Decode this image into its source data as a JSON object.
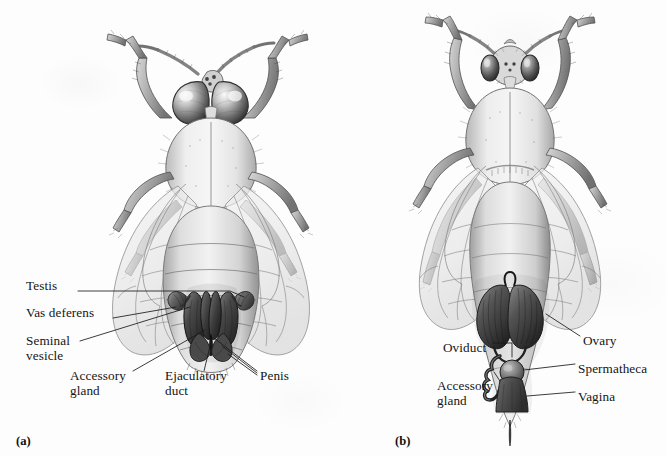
{
  "figure": {
    "kind": "scientific-illustration",
    "background_color": "#fdfdfd",
    "ink_color": "#151515",
    "width": 667,
    "height": 456
  },
  "panels": [
    {
      "id": "a",
      "panel_label": "(a)",
      "caption_subject": "drone",
      "labels": [
        {
          "text": "Testis",
          "x": 26,
          "y": 285
        },
        {
          "text": "Vas deferens",
          "x": 26,
          "y": 312
        },
        {
          "text": "Seminal",
          "x": 26,
          "y": 340
        },
        {
          "text": "vesicle",
          "x": 26,
          "y": 355
        },
        {
          "text": "Accessory",
          "x": 70,
          "y": 375
        },
        {
          "text": "gland",
          "x": 70,
          "y": 390
        },
        {
          "text": "Ejaculatory",
          "x": 165,
          "y": 375
        },
        {
          "text": "duct",
          "x": 165,
          "y": 390
        },
        {
          "text": "Penis",
          "x": 260,
          "y": 375
        }
      ]
    },
    {
      "id": "b",
      "panel_label": "(b)",
      "caption_subject": "queen",
      "labels": [
        {
          "text": "Oviduct",
          "x": 443,
          "y": 347
        },
        {
          "text": "Ovary",
          "x": 583,
          "y": 340
        },
        {
          "text": "Spermatheca",
          "x": 578,
          "y": 368
        },
        {
          "text": "Accessory",
          "x": 437,
          "y": 385
        },
        {
          "text": "gland",
          "x": 437,
          "y": 400
        },
        {
          "text": "Vagina",
          "x": 578,
          "y": 396
        }
      ]
    }
  ],
  "panel_ids": [
    {
      "text": "(a)",
      "x": 16,
      "y": 434
    },
    {
      "text": "(b)",
      "x": 395,
      "y": 434
    }
  ]
}
